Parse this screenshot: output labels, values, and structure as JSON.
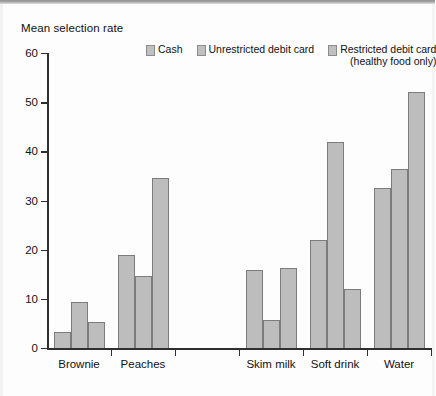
{
  "chart_data": {
    "type": "bar",
    "title": "",
    "ylabel": "Mean selection rate",
    "xlabel": "",
    "ylim": [
      0,
      60
    ],
    "yticks": [
      0,
      10,
      20,
      30,
      40,
      50,
      60
    ],
    "grid": false,
    "legend_position": "top",
    "categories": [
      "Brownie",
      "Peaches",
      "",
      "Skim milk",
      "Soft drink",
      "Water"
    ],
    "series": [
      {
        "name": "Cash",
        "values": [
          3.3,
          19.0,
          null,
          15.8,
          22.0,
          32.5
        ]
      },
      {
        "name": "Unrestricted debit card",
        "values": [
          9.3,
          14.7,
          null,
          5.6,
          42.0,
          36.5
        ]
      },
      {
        "name": "Restricted debit card (healthy food only)",
        "values": [
          5.3,
          34.5,
          null,
          16.3,
          12.0,
          52.0
        ]
      }
    ],
    "colors": {
      "bar_fill": "#bdbdbd",
      "bar_stroke": "#7c7c7c",
      "axis": "#2f2f2f"
    }
  },
  "legend": {
    "items": [
      {
        "label": "Cash",
        "sub": ""
      },
      {
        "label": "Unrestricted debit card",
        "sub": ""
      },
      {
        "label": "Restricted debit card",
        "sub": "(healthy food only)"
      }
    ]
  },
  "axis": {
    "y_title": "Mean selection rate",
    "y_tick_labels": [
      "60",
      "50",
      "40",
      "30",
      "20",
      "10",
      "0"
    ],
    "x_tick_labels": [
      "Brownie",
      "Peaches",
      "Skim milk",
      "Soft drink",
      "Water"
    ]
  }
}
